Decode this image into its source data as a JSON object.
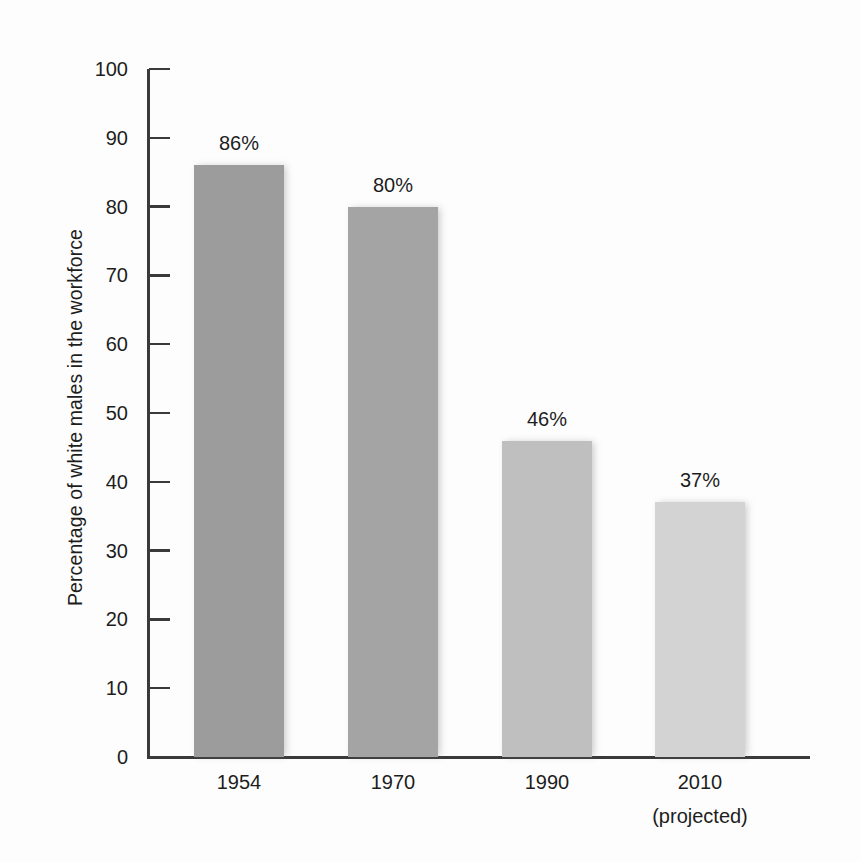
{
  "chart_data": {
    "type": "bar",
    "title": "",
    "xlabel": "",
    "ylabel": "Percentage of white males in the workforce",
    "categories": [
      "1954",
      "1970",
      "1990",
      "2010"
    ],
    "category_sublabels": [
      "",
      "",
      "",
      "(projected)"
    ],
    "values": [
      86,
      80,
      46,
      37
    ],
    "value_labels": [
      "86%",
      "80%",
      "46%",
      "37%"
    ],
    "ylim": [
      0,
      100
    ],
    "ytick_labels": [
      "0",
      "10",
      "20",
      "30",
      "40",
      "50",
      "60",
      "70",
      "80",
      "90",
      "100"
    ],
    "ytick_values": [
      0,
      10,
      20,
      30,
      40,
      50,
      60,
      70,
      80,
      90,
      100
    ],
    "grid": false,
    "legend": null,
    "bar_colors": [
      "#9c9c9c",
      "#a4a4a4",
      "#bfbfbf",
      "#d3d3d3"
    ],
    "axis_color": "#3a3a3a",
    "text_color": "#1d1d1d",
    "background": "#fdfdfd"
  }
}
